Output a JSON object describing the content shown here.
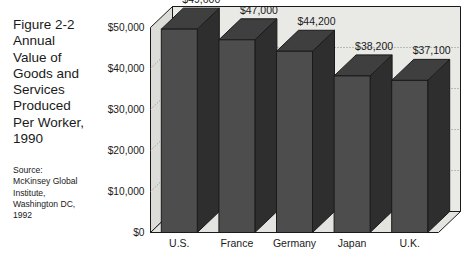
{
  "caption": {
    "lines": [
      "Figure 2-2",
      "Annual",
      "Value of",
      "Goods and",
      "Services",
      "Produced",
      "Per Worker,",
      "1990"
    ]
  },
  "source": {
    "lines": [
      "Source:",
      "McKinsey Global",
      "Institute,",
      "Washington DC,",
      "1992"
    ]
  },
  "chart_data": {
    "type": "bar",
    "title": "Figure 2-2 Annual Value of Goods and Services Produced Per Worker, 1990",
    "categories": [
      "U.S.",
      "France",
      "Germany",
      "Japan",
      "U.K."
    ],
    "values": [
      49600,
      47000,
      44200,
      38200,
      37100
    ],
    "value_labels": [
      "$49,600",
      "$47,000",
      "$44,200",
      "$38,200",
      "$37,100"
    ],
    "ylabel": "",
    "xlabel": "",
    "ylim": [
      0,
      50000
    ],
    "ytick_values": [
      0,
      10000,
      20000,
      30000,
      40000,
      50000
    ],
    "ytick_labels": [
      "$0",
      "$10,000",
      "$20,000",
      "$30,000",
      "$40,000",
      "$50,000"
    ],
    "grid": true,
    "legend": "none",
    "style": "3d-column",
    "colors": {
      "bar_front": "#4d4d4d",
      "bar_top": "#3f3f3f",
      "bar_side": "#2e2e2e",
      "wall_back": "#e9e9e6",
      "wall_side": "#dcdcd8",
      "floor": "#e3e3df",
      "outline": "#1a1a1a",
      "gridline": "#8a8a8a"
    }
  }
}
